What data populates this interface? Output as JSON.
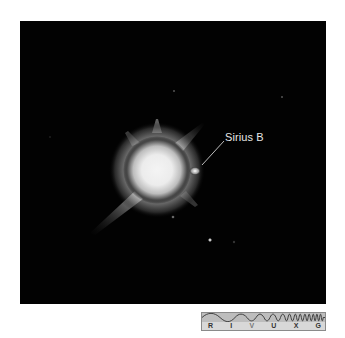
{
  "figure": {
    "annotation": "Sirius B",
    "background_color": "#020202",
    "star_color": "#f2f2f2"
  },
  "spectrum_bar": {
    "bands": [
      "R",
      "I",
      "V",
      "U",
      "X",
      "G"
    ],
    "highlighted_bands": [
      "R",
      "I",
      "U",
      "X",
      "G"
    ],
    "dim_bands": [
      "V"
    ]
  }
}
